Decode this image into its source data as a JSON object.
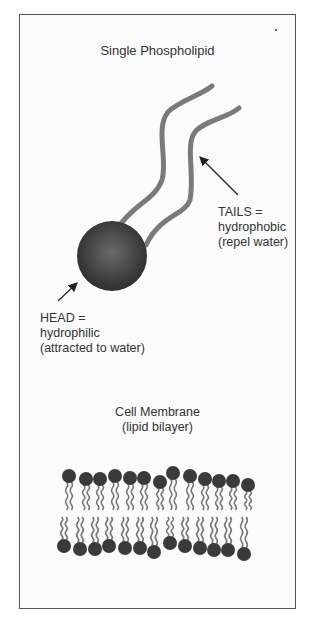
{
  "title": "Single Phospholipid",
  "head_label": {
    "line1": "HEAD =",
    "line2": "hydrophilic",
    "line3": "(attracted to water)"
  },
  "tails_label": {
    "line1": "TAILS =",
    "line2": "hydrophobic",
    "line3": "(repel water)"
  },
  "membrane_label": {
    "line1": "Cell Membrane",
    "line2": "(lipid bilayer)"
  },
  "colors": {
    "head": "#3a3a3a",
    "tail": "#7a7a7a",
    "text": "#333333",
    "border": "#555555"
  },
  "bilayer": {
    "top_heads": 13,
    "bottom_heads": 13
  }
}
